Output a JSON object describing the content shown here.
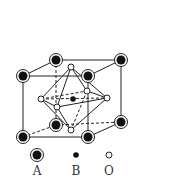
{
  "diagram": {
    "colors": {
      "line": "#222222",
      "atom_fill": "#111111",
      "o_fill": "#ffffff",
      "background": "#ffffff"
    },
    "cube": {
      "front": {
        "tl": [
          23,
          76
        ],
        "tr": [
          88,
          76
        ],
        "bl": [
          23,
          137
        ],
        "br": [
          88,
          137
        ]
      },
      "back": {
        "tl": [
          56,
          60
        ],
        "tr": [
          121,
          60
        ],
        "bl": [
          56,
          125
        ],
        "br": [
          121,
          122
        ]
      }
    },
    "octahedron": {
      "top": [
        71,
        67
      ],
      "bottom": [
        71,
        130
      ],
      "left": [
        41,
        99
      ],
      "right": [
        107,
        98
      ],
      "front": [
        57,
        107
      ],
      "back": [
        87,
        91
      ]
    },
    "b_center": [
      73,
      99
    ],
    "legend": [
      {
        "symbol": "A",
        "label": "A"
      },
      {
        "symbol": "B",
        "label": "B"
      },
      {
        "symbol": "O",
        "label": "O"
      }
    ]
  }
}
